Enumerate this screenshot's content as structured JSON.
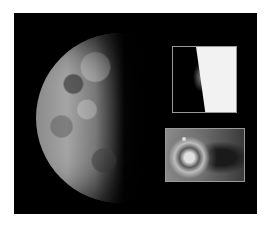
{
  "image": {
    "subject": "Io moon with volcanic plume insets",
    "background_color": "#000000",
    "frame_border_color": "#ffffff",
    "inset_border_color": "#9a9a9a",
    "insets": [
      {
        "position": "top-right",
        "content": "limb with plume"
      },
      {
        "position": "bottom-right",
        "content": "volcanic vent close-up"
      }
    ]
  }
}
